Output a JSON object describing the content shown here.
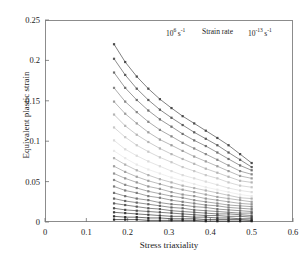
{
  "chart_data": {
    "type": "line",
    "title": "",
    "xlabel": "Stress triaxiality",
    "ylabel": "Equivalent plastic strain",
    "xlim": [
      0,
      0.6
    ],
    "ylim": [
      0,
      0.25
    ],
    "xticks": [
      "0",
      "0.1",
      "0.2",
      "0.3",
      "0.4",
      "0.5",
      "0.6"
    ],
    "xtick_values": [
      0,
      0.1,
      0.2,
      0.3,
      0.4,
      0.5,
      0.6
    ],
    "yticks": [
      "0",
      "0.05",
      "0.1",
      "0.15",
      "0.2",
      "0.25"
    ],
    "ytick_values": [
      0,
      0.05,
      0.1,
      0.15,
      0.2,
      0.25
    ],
    "grid": false,
    "legend": "none",
    "marker": "square",
    "annotations": [
      {
        "name": "strain-rate-high",
        "text": "10",
        "sup": "6",
        "unit": "s",
        "unit_sup": "-1"
      },
      {
        "name": "strain-rate-caption",
        "text": "Strain rate"
      },
      {
        "name": "strain-rate-low",
        "text": "10",
        "sup": "-13",
        "unit": "s",
        "unit_sup": "-1"
      }
    ],
    "x": [
      0.167,
      0.194,
      0.222,
      0.25,
      0.278,
      0.306,
      0.333,
      0.361,
      0.389,
      0.417,
      0.444,
      0.472,
      0.5
    ],
    "series": [
      {
        "name": "rate-01",
        "color": "#4a4a4a",
        "values": [
          0.22,
          0.198,
          0.18,
          0.165,
          0.152,
          0.141,
          0.131,
          0.122,
          0.113,
          0.104,
          0.095,
          0.084,
          0.073
        ]
      },
      {
        "name": "rate-02",
        "color": "#5a5a5a",
        "values": [
          0.202,
          0.182,
          0.165,
          0.151,
          0.139,
          0.129,
          0.12,
          0.111,
          0.103,
          0.095,
          0.086,
          0.077,
          0.068
        ]
      },
      {
        "name": "rate-03",
        "color": "#6e6e6e",
        "values": [
          0.185,
          0.166,
          0.151,
          0.138,
          0.127,
          0.118,
          0.109,
          0.101,
          0.094,
          0.086,
          0.078,
          0.07,
          0.064
        ]
      },
      {
        "name": "rate-04",
        "color": "#868686",
        "values": [
          0.166,
          0.149,
          0.136,
          0.124,
          0.114,
          0.106,
          0.098,
          0.091,
          0.084,
          0.077,
          0.07,
          0.063,
          0.059
        ]
      },
      {
        "name": "rate-05",
        "color": "#9c9c9c",
        "values": [
          0.149,
          0.134,
          0.122,
          0.111,
          0.102,
          0.095,
          0.088,
          0.081,
          0.075,
          0.069,
          0.063,
          0.057,
          0.054
        ]
      },
      {
        "name": "rate-06",
        "color": "#b4b4b4",
        "values": [
          0.133,
          0.119,
          0.108,
          0.099,
          0.091,
          0.084,
          0.078,
          0.072,
          0.066,
          0.061,
          0.056,
          0.051,
          0.049
        ]
      },
      {
        "name": "rate-07",
        "color": "#c8c8c8",
        "values": [
          0.117,
          0.105,
          0.095,
          0.087,
          0.08,
          0.074,
          0.068,
          0.063,
          0.058,
          0.054,
          0.049,
          0.045,
          0.043
        ]
      },
      {
        "name": "rate-08",
        "color": "#dadada",
        "values": [
          0.101,
          0.09,
          0.082,
          0.075,
          0.069,
          0.063,
          0.058,
          0.054,
          0.05,
          0.046,
          0.042,
          0.039,
          0.037
        ]
      },
      {
        "name": "rate-09",
        "color": "#e8e8e8",
        "values": [
          0.088,
          0.079,
          0.071,
          0.065,
          0.06,
          0.055,
          0.051,
          0.047,
          0.043,
          0.04,
          0.037,
          0.034,
          0.032
        ]
      },
      {
        "name": "rate-10",
        "color": "#b0b0b0",
        "values": [
          0.079,
          0.071,
          0.064,
          0.058,
          0.053,
          0.049,
          0.045,
          0.042,
          0.039,
          0.036,
          0.033,
          0.03,
          0.029
        ]
      },
      {
        "name": "rate-11",
        "color": "#a0a0a0",
        "values": [
          0.069,
          0.062,
          0.056,
          0.051,
          0.047,
          0.043,
          0.04,
          0.037,
          0.034,
          0.031,
          0.029,
          0.027,
          0.025
        ]
      },
      {
        "name": "rate-12",
        "color": "#949494",
        "values": [
          0.06,
          0.054,
          0.049,
          0.044,
          0.041,
          0.037,
          0.034,
          0.032,
          0.029,
          0.027,
          0.025,
          0.023,
          0.022
        ]
      },
      {
        "name": "rate-13",
        "color": "#888888",
        "values": [
          0.052,
          0.046,
          0.042,
          0.038,
          0.035,
          0.032,
          0.03,
          0.027,
          0.025,
          0.023,
          0.021,
          0.02,
          0.019
        ]
      },
      {
        "name": "rate-14",
        "color": "#7c7c7c",
        "values": [
          0.044,
          0.039,
          0.036,
          0.032,
          0.03,
          0.027,
          0.025,
          0.023,
          0.021,
          0.02,
          0.018,
          0.017,
          0.016
        ]
      },
      {
        "name": "rate-15",
        "color": "#707070",
        "values": [
          0.036,
          0.032,
          0.029,
          0.027,
          0.024,
          0.022,
          0.021,
          0.019,
          0.018,
          0.016,
          0.015,
          0.014,
          0.013
        ]
      },
      {
        "name": "rate-16",
        "color": "#646464",
        "values": [
          0.029,
          0.026,
          0.024,
          0.022,
          0.02,
          0.018,
          0.017,
          0.015,
          0.014,
          0.013,
          0.012,
          0.011,
          0.011
        ]
      },
      {
        "name": "rate-17",
        "color": "#585858",
        "values": [
          0.023,
          0.021,
          0.019,
          0.017,
          0.016,
          0.014,
          0.013,
          0.012,
          0.011,
          0.01,
          0.01,
          0.009,
          0.008
        ]
      },
      {
        "name": "rate-18",
        "color": "#4c4c4c",
        "values": [
          0.017,
          0.015,
          0.014,
          0.013,
          0.012,
          0.011,
          0.01,
          0.009,
          0.008,
          0.008,
          0.007,
          0.007,
          0.006
        ]
      },
      {
        "name": "rate-19",
        "color": "#3e3e3e",
        "values": [
          0.012,
          0.011,
          0.01,
          0.009,
          0.008,
          0.007,
          0.007,
          0.006,
          0.006,
          0.005,
          0.005,
          0.004,
          0.004
        ]
      },
      {
        "name": "rate-20",
        "color": "#303030",
        "values": [
          0.007,
          0.006,
          0.006,
          0.005,
          0.005,
          0.004,
          0.004,
          0.004,
          0.003,
          0.003,
          0.003,
          0.003,
          0.002
        ]
      },
      {
        "name": "rate-21",
        "color": "#222222",
        "values": [
          0.003,
          0.003,
          0.003,
          0.002,
          0.002,
          0.002,
          0.002,
          0.002,
          0.001,
          0.001,
          0.001,
          0.001,
          0.001
        ]
      }
    ]
  }
}
